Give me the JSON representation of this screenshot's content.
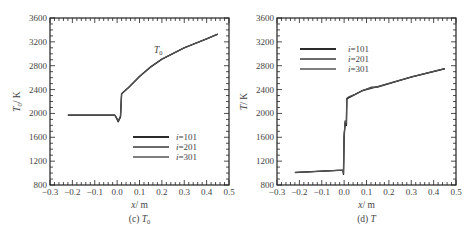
{
  "chart_data": [
    {
      "type": "line",
      "panel": "c",
      "caption": "(c) T₀",
      "title": "",
      "xlabel": "x / m",
      "ylabel": "T₀ / K",
      "xlim": [
        -0.3,
        0.5
      ],
      "ylim": [
        800,
        3600
      ],
      "xticks": [
        "-0.3",
        "-0.2",
        "-0.1",
        "0.0",
        "0.1",
        "0.2",
        "0.3",
        "0.4",
        "0.5"
      ],
      "yticks": [
        "800",
        "1200",
        "1600",
        "2000",
        "2400",
        "2800",
        "3200",
        "3600"
      ],
      "grid": false,
      "legend_position": "lower right",
      "annotation": "T₀",
      "series": [
        {
          "name": "i=101",
          "x": [
            -0.22,
            -0.01,
            0.0,
            0.005,
            0.015,
            0.02,
            0.05,
            0.1,
            0.15,
            0.2,
            0.3,
            0.4,
            0.45
          ],
          "y": [
            1970,
            1970,
            1900,
            1860,
            1940,
            2330,
            2430,
            2620,
            2780,
            2910,
            3100,
            3250,
            3330
          ]
        },
        {
          "name": "i=201",
          "x": [
            -0.22,
            -0.01,
            0.0,
            0.005,
            0.015,
            0.02,
            0.05,
            0.1,
            0.15,
            0.2,
            0.3,
            0.4,
            0.45
          ],
          "y": [
            1970,
            1970,
            1910,
            1870,
            1950,
            2330,
            2430,
            2620,
            2780,
            2910,
            3100,
            3250,
            3330
          ]
        },
        {
          "name": "i=301",
          "x": [
            -0.22,
            -0.01,
            0.0,
            0.005,
            0.015,
            0.02,
            0.05,
            0.1,
            0.15,
            0.2,
            0.3,
            0.4,
            0.45
          ],
          "y": [
            1970,
            1970,
            1920,
            1880,
            1960,
            2330,
            2430,
            2620,
            2780,
            2910,
            3100,
            3250,
            3330
          ]
        }
      ]
    },
    {
      "type": "line",
      "panel": "d",
      "caption": "(d) T",
      "title": "",
      "xlabel": "x / m",
      "ylabel": "T / K",
      "xlim": [
        -0.3,
        0.5
      ],
      "ylim": [
        800,
        3600
      ],
      "xticks": [
        "-0.3",
        "-0.2",
        "-0.1",
        "0.0",
        "0.1",
        "0.2",
        "0.3",
        "0.4",
        "0.5"
      ],
      "yticks": [
        "800",
        "1200",
        "1600",
        "2000",
        "2400",
        "2800",
        "3200",
        "3600"
      ],
      "grid": false,
      "legend_position": "upper left",
      "series": [
        {
          "name": "i=101",
          "x": [
            -0.22,
            -0.005,
            -0.003,
            0.0,
            0.005,
            0.01,
            0.012,
            0.02,
            0.05,
            0.08,
            0.12,
            0.15,
            0.3,
            0.45
          ],
          "y": [
            1010,
            1050,
            980,
            1600,
            1850,
            1800,
            2240,
            2260,
            2320,
            2380,
            2420,
            2450,
            2610,
            2750
          ]
        },
        {
          "name": "i=201",
          "x": [
            -0.22,
            -0.005,
            -0.003,
            0.0,
            0.005,
            0.01,
            0.012,
            0.02,
            0.05,
            0.08,
            0.12,
            0.15,
            0.3,
            0.45
          ],
          "y": [
            1010,
            1050,
            990,
            1620,
            1870,
            1820,
            2250,
            2270,
            2320,
            2380,
            2440,
            2440,
            2610,
            2750
          ]
        },
        {
          "name": "i=301",
          "x": [
            -0.22,
            -0.005,
            -0.003,
            0.0,
            0.005,
            0.01,
            0.012,
            0.02,
            0.05,
            0.08,
            0.12,
            0.15,
            0.3,
            0.45
          ],
          "y": [
            1010,
            1050,
            1000,
            1640,
            1880,
            1840,
            2260,
            2280,
            2320,
            2380,
            2430,
            2450,
            2610,
            2750
          ]
        }
      ]
    }
  ],
  "panels": {
    "c": {
      "caption_prefix": "(c) ",
      "caption_var": "T",
      "caption_sub": "0",
      "xlabel_var": "x",
      "xlabel_unit": "/ m",
      "ylabel_var": "T",
      "ylabel_sub": "0",
      "ylabel_unit": "/ K",
      "annotation_var": "T",
      "annotation_sub": "0"
    },
    "d": {
      "caption_prefix": "(d) ",
      "caption_var": "T",
      "xlabel_var": "x",
      "xlabel_unit": "/ m",
      "ylabel_var": "T",
      "ylabel_unit": "/ K"
    }
  },
  "legend": {
    "items": [
      "i=101",
      "i=201",
      "i=301"
    ]
  },
  "colors": {
    "line": "#3a3a3a",
    "axis": "#222222",
    "text": "#444444"
  }
}
